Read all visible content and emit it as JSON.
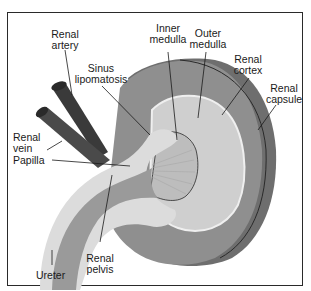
{
  "figure": {
    "colors": {
      "frame": "#2a2a2a",
      "capsule": "#6e6e6e",
      "cortex": "#8f8f8f",
      "outer_medulla": "#c9c9c9",
      "inner_medulla": "#bdbdbd",
      "sinus_fat": "#dcdcdc",
      "pelvis": "#9a9a9a",
      "vessels": "#3a3a3a",
      "leader_lines": "#1a1a1a"
    },
    "labels": [
      {
        "id": "renal-artery",
        "text": "Renal\nartery"
      },
      {
        "id": "inner-medulla",
        "text": "Inner\nmedulla"
      },
      {
        "id": "outer-medulla",
        "text": "Outer\nmedulla"
      },
      {
        "id": "renal-cortex",
        "text": "Renal\ncortex"
      },
      {
        "id": "renal-capsule",
        "text": "Renal\ncapsule"
      },
      {
        "id": "sinus-lipomatosis",
        "text": "Sinus\nlipomatosis"
      },
      {
        "id": "renal-vein",
        "text": "Renal\nvein"
      },
      {
        "id": "papilla",
        "text": "Papilla"
      },
      {
        "id": "renal-pelvis",
        "text": "Renal\npelvis"
      },
      {
        "id": "ureter",
        "text": "Ureter"
      }
    ]
  }
}
